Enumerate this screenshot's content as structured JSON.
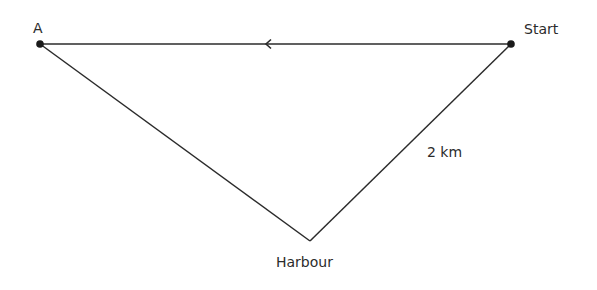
{
  "diagram": {
    "type": "triangle-route",
    "colors": {
      "line": "#2b2b2b",
      "point": "#1a1a1a",
      "text": "#2b2b2b",
      "background": "#ffffff"
    },
    "points": [
      {
        "id": "A",
        "label": "A",
        "x": 40,
        "y": 44,
        "marked": true
      },
      {
        "id": "start",
        "label": "Start",
        "x": 511,
        "y": 44,
        "marked": true
      },
      {
        "id": "harbour",
        "label": "Harbour",
        "x": 310,
        "y": 241,
        "marked": false
      }
    ],
    "edges": [
      {
        "from": "start",
        "to": "A",
        "direction_arrow": "left",
        "arrow_x": 267
      },
      {
        "from": "A",
        "to": "harbour"
      },
      {
        "from": "harbour",
        "to": "start",
        "length_label": "2 km"
      }
    ],
    "labels": {
      "point_a": "A",
      "start": "Start",
      "harbour": "Harbour",
      "distance": "2 km"
    }
  }
}
